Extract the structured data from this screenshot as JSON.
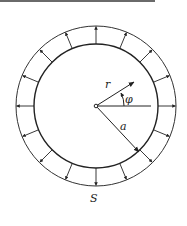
{
  "diagram": {
    "type": "circular-ring-radial-load",
    "labels": {
      "radius": "r",
      "angle": "φ",
      "inner_radius": "a",
      "ring": "S"
    },
    "geometry": {
      "center": [
        96,
        106
      ],
      "outer_radius": 80,
      "inner_radius": 62,
      "radial_arrow_count": 16,
      "stroke_color": "#222222"
    }
  }
}
